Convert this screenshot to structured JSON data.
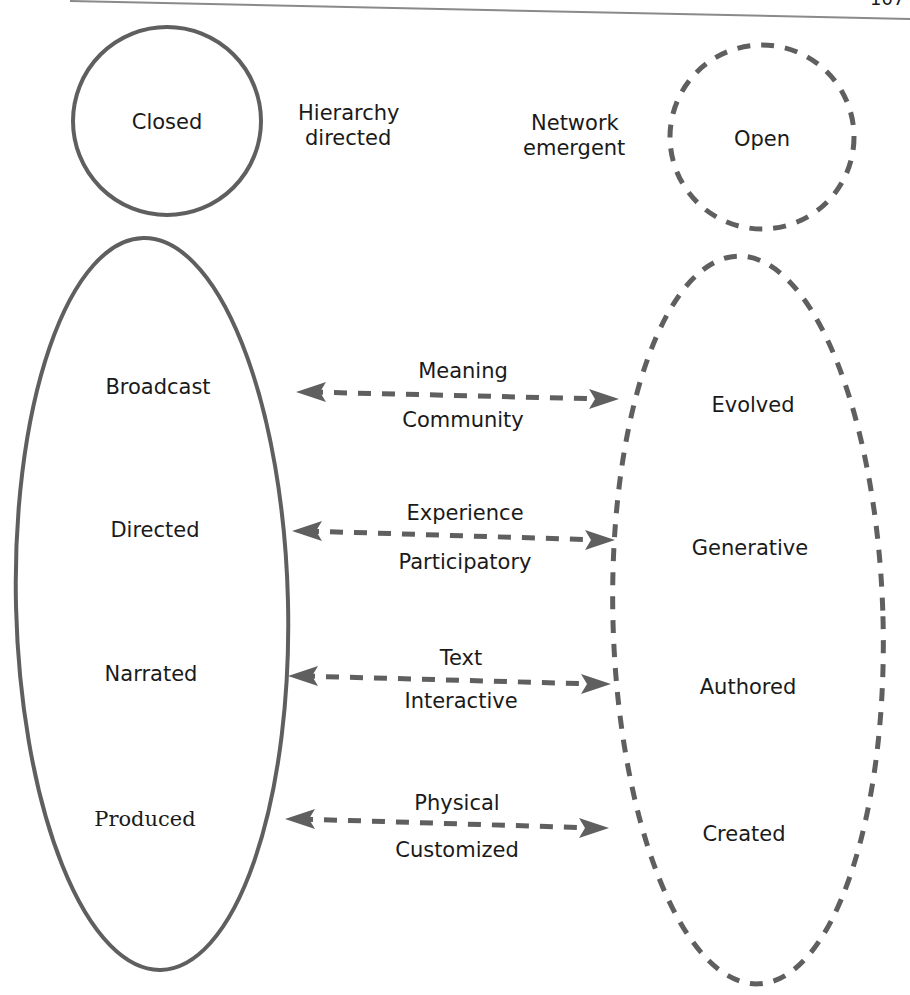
{
  "page": {
    "page_number": "107"
  },
  "top": {
    "closed": {
      "label": "Closed"
    },
    "hierarchy": {
      "line1": "Hierarchy",
      "line2": "directed"
    },
    "network": {
      "line1": "Network",
      "line2": "emergent"
    },
    "open": {
      "label": "Open"
    }
  },
  "left_column": {
    "items": [
      {
        "label": "Broadcast"
      },
      {
        "label": "Directed"
      },
      {
        "label": "Narrated"
      },
      {
        "label": "Produced"
      }
    ]
  },
  "right_column": {
    "items": [
      {
        "label": "Evolved"
      },
      {
        "label": "Generative"
      },
      {
        "label": "Authored"
      },
      {
        "label": "Created"
      }
    ]
  },
  "connectors": [
    {
      "top": "Meaning",
      "bottom": "Community"
    },
    {
      "top": "Experience",
      "bottom": "Participatory"
    },
    {
      "top": "Text",
      "bottom": "Interactive"
    },
    {
      "top": "Physical",
      "bottom": "Customized"
    }
  ],
  "colors": {
    "stroke": "#5f5f5f",
    "text": "#1a1a1a",
    "rule": "#8a8a8a"
  }
}
